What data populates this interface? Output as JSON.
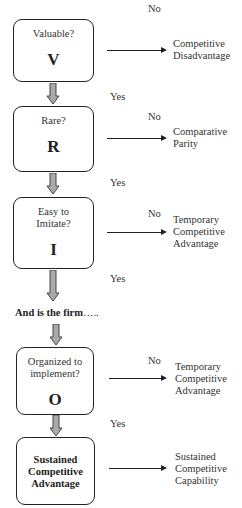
{
  "diagram": {
    "type": "flowchart",
    "clipped_top_text": "· · ·",
    "steps": [
      {
        "question": "Valuable?",
        "letter": "V",
        "no_label": "No",
        "no_outcome_lines": [
          "Competitive",
          "Disadvantage"
        ],
        "yes_label": "Yes"
      },
      {
        "question": "Rare?",
        "letter": "R",
        "no_label": "No",
        "no_outcome_lines": [
          "Comparative",
          "Parity"
        ],
        "yes_label": "Yes"
      },
      {
        "question_lines": [
          "Easy to",
          "Imitate?"
        ],
        "letter": "I",
        "no_label": "No",
        "no_outcome_lines": [
          "Temporary",
          "Competitive",
          "Advantage"
        ],
        "yes_label": "Yes"
      },
      {
        "question_lines": [
          "Organized to",
          "implement?"
        ],
        "letter": "O",
        "no_label": "No",
        "no_outcome_lines": [
          "Temporary",
          "Competitive",
          "Advantage"
        ],
        "yes_label": "Yes"
      }
    ],
    "connector": {
      "text": "And is the firm",
      "dots": "….."
    },
    "final": {
      "lines": [
        "Sustained",
        "Competitive",
        "Advantage"
      ],
      "outcome_lines": [
        "Sustained",
        "Competitive",
        "Capability"
      ]
    },
    "colors": {
      "box_border": "#222222",
      "down_arrow_fill": "#a9a9a9",
      "down_arrow_stroke": "#444444",
      "line": "#222222"
    }
  }
}
